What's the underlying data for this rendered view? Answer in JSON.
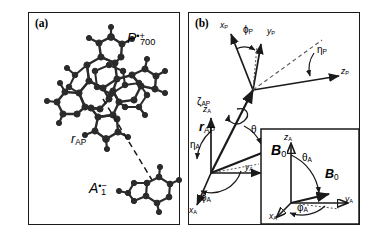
{
  "figure": {
    "type": "scientific-diagram",
    "background": "#ffffff",
    "line_color": "#1a1a1a"
  },
  "panels": {
    "a": {
      "tag": "(a)",
      "donor_label": {
        "base": "P",
        "superscript": "•+",
        "subscript": "700"
      },
      "acceptor_label": {
        "base": "A",
        "superscript": "•−",
        "subscript": "1"
      },
      "distance_label": {
        "base": "r",
        "subscript": "AP"
      },
      "connector_style": "dashed"
    },
    "b": {
      "tag": "(b)",
      "p_frame": {
        "axes": [
          {
            "name": "x-axis-p",
            "base": "x",
            "subscript": "P"
          },
          {
            "name": "y-axis-p",
            "base": "y",
            "subscript": "P"
          },
          {
            "name": "z-axis-p",
            "base": "z",
            "subscript": "P"
          }
        ],
        "angles": [
          {
            "name": "phi-p",
            "symbol": "ϕ",
            "subscript": "P"
          },
          {
            "name": "eta-p",
            "symbol": "η",
            "subscript": "P"
          }
        ]
      },
      "a_frame": {
        "axes": [
          {
            "name": "x-axis-a",
            "base": "x",
            "subscript": "A"
          },
          {
            "name": "y-axis-a",
            "base": "y",
            "subscript": "A"
          },
          {
            "name": "z-axis-a",
            "base": "z",
            "subscript": "A"
          }
        ],
        "angles": [
          {
            "name": "phi-a",
            "symbol": "ϕ",
            "subscript": "A"
          },
          {
            "name": "eta-a",
            "symbol": "η",
            "subscript": "A"
          }
        ]
      },
      "dihedral": {
        "symbol": "ζ",
        "subscript": "AP"
      },
      "theta": {
        "symbol": "θ"
      },
      "field_vector": {
        "base": "B",
        "subscript": "0"
      },
      "distance_vector": {
        "base": "r",
        "subscript": "AP"
      },
      "inset": {
        "axes": [
          {
            "name": "x-axis-a-inset",
            "base": "x",
            "subscript": "A"
          },
          {
            "name": "y-axis-a-inset",
            "base": "y",
            "subscript": "A"
          },
          {
            "name": "z-axis-a-inset",
            "base": "z",
            "subscript": "A"
          }
        ],
        "theta_a": {
          "symbol": "θ",
          "subscript": "A"
        },
        "phi_a": {
          "symbol": "φ",
          "subscript": "A"
        },
        "field_vector": {
          "base": "B",
          "subscript": "0"
        }
      }
    }
  }
}
